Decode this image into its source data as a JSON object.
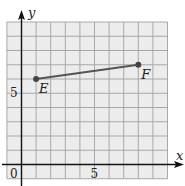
{
  "chart_data": {
    "type": "line",
    "title": "",
    "xlabel": "x",
    "ylabel": "y",
    "xlim": [
      -1,
      10
    ],
    "ylim": [
      -1,
      10
    ],
    "grid": true,
    "x_ticks": [
      {
        "value": 0,
        "label": "0"
      },
      {
        "value": 5,
        "label": "5"
      }
    ],
    "y_ticks": [
      {
        "value": 5,
        "label": "5"
      }
    ],
    "points": [
      {
        "name": "E",
        "x": 1,
        "y": 6
      },
      {
        "name": "F",
        "x": 8,
        "y": 7
      }
    ],
    "segments": [
      {
        "from": "E",
        "to": "F"
      }
    ]
  },
  "colors": {
    "grid_bg": "#ececec",
    "grid_line": "#a8a8a8",
    "axis": "#111111",
    "segment": "#555555",
    "point": "#444444"
  }
}
